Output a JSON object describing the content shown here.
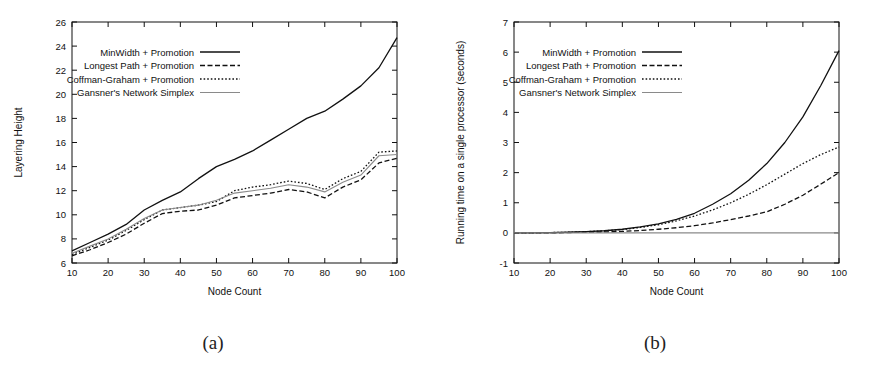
{
  "figure": {
    "caption_a": "(a)",
    "caption_b": "(b)"
  },
  "legend_entries": [
    {
      "label": "MinWidth + Promotion",
      "style": "solid",
      "color": "#111111",
      "width": 1.3
    },
    {
      "label": "Longest Path + Promotion",
      "style": "dashed",
      "color": "#111111",
      "width": 1.3
    },
    {
      "label": "Coffman-Graham + Promotion",
      "style": "dotted",
      "color": "#111111",
      "width": 1.3
    },
    {
      "label": "Gansner's Network Simplex",
      "style": "solid",
      "color": "#8a8a8a",
      "width": 1.1
    }
  ],
  "chart_data": [
    {
      "id": "chart-a",
      "type": "line",
      "title": "",
      "xlabel": "Node Count",
      "ylabel": "Layering Height",
      "xlim": [
        10,
        100
      ],
      "ylim": [
        6,
        26
      ],
      "xticks": [
        10,
        20,
        30,
        40,
        50,
        60,
        70,
        80,
        90,
        100
      ],
      "yticks": [
        6,
        8,
        10,
        12,
        14,
        16,
        18,
        20,
        22,
        24,
        26
      ],
      "grid": false,
      "legend_position": "top-center",
      "x": [
        10,
        15,
        20,
        25,
        30,
        35,
        40,
        45,
        50,
        55,
        60,
        65,
        70,
        75,
        80,
        85,
        90,
        95,
        100
      ],
      "series": [
        {
          "name": "MinWidth + Promotion",
          "style": "solid",
          "color": "#111111",
          "width": 1.3,
          "values": [
            7.0,
            7.7,
            8.4,
            9.2,
            10.4,
            11.2,
            11.9,
            13.0,
            14.0,
            14.6,
            15.3,
            16.2,
            17.1,
            18.0,
            18.6,
            19.6,
            20.7,
            22.2,
            24.7
          ]
        },
        {
          "name": "Longest Path + Promotion",
          "style": "dashed",
          "color": "#111111",
          "width": 1.3,
          "values": [
            6.6,
            7.1,
            7.7,
            8.4,
            9.3,
            10.1,
            10.3,
            10.4,
            10.8,
            11.4,
            11.6,
            11.8,
            12.1,
            11.9,
            11.4,
            12.3,
            12.9,
            14.3,
            14.7
          ]
        },
        {
          "name": "Coffman-Graham + Promotion",
          "style": "dotted",
          "color": "#111111",
          "width": 1.3,
          "values": [
            6.7,
            7.3,
            7.9,
            8.7,
            9.6,
            10.4,
            10.6,
            10.8,
            11.1,
            12.0,
            12.3,
            12.5,
            12.8,
            12.6,
            12.1,
            13.0,
            13.6,
            15.2,
            15.3
          ]
        },
        {
          "name": "Gansner's Network Simplex",
          "style": "solid",
          "color": "#8a8a8a",
          "width": 1.1,
          "values": [
            6.8,
            7.4,
            8.0,
            8.8,
            9.7,
            10.4,
            10.6,
            10.8,
            11.2,
            11.8,
            12.0,
            12.2,
            12.5,
            12.3,
            11.9,
            12.7,
            13.3,
            14.9,
            15.0
          ]
        }
      ]
    },
    {
      "id": "chart-b",
      "type": "line",
      "title": "",
      "xlabel": "Node Count",
      "ylabel": "Running time on a single processor (seconds)",
      "xlim": [
        10,
        100
      ],
      "ylim": [
        -1,
        7
      ],
      "xticks": [
        10,
        20,
        30,
        40,
        50,
        60,
        70,
        80,
        90,
        100
      ],
      "yticks": [
        -1,
        0,
        1,
        2,
        3,
        4,
        5,
        6,
        7
      ],
      "grid": false,
      "legend_position": "top-center",
      "x": [
        10,
        15,
        20,
        25,
        30,
        35,
        40,
        45,
        50,
        55,
        60,
        65,
        70,
        75,
        80,
        85,
        90,
        95,
        100
      ],
      "series": [
        {
          "name": "MinWidth + Promotion",
          "style": "solid",
          "color": "#111111",
          "width": 1.3,
          "values": [
            0.0,
            0.0,
            0.01,
            0.02,
            0.04,
            0.07,
            0.12,
            0.2,
            0.3,
            0.45,
            0.65,
            0.95,
            1.3,
            1.75,
            2.3,
            3.0,
            3.85,
            4.9,
            6.05
          ]
        },
        {
          "name": "Longest Path + Promotion",
          "style": "dashed",
          "color": "#111111",
          "width": 1.3,
          "values": [
            0.0,
            0.0,
            0.0,
            0.01,
            0.02,
            0.03,
            0.05,
            0.08,
            0.12,
            0.17,
            0.24,
            0.33,
            0.44,
            0.56,
            0.7,
            0.95,
            1.25,
            1.62,
            2.0
          ]
        },
        {
          "name": "Coffman-Graham + Promotion",
          "style": "dotted",
          "color": "#111111",
          "width": 1.3,
          "values": [
            0.0,
            0.0,
            0.01,
            0.02,
            0.04,
            0.07,
            0.11,
            0.18,
            0.27,
            0.4,
            0.56,
            0.76,
            1.0,
            1.28,
            1.6,
            1.95,
            2.3,
            2.6,
            2.85
          ]
        },
        {
          "name": "Gansner's Network Simplex",
          "style": "solid",
          "color": "#8a8a8a",
          "width": 1.1,
          "values": [
            0.0,
            0.0,
            0.0,
            0.0,
            0.0,
            0.0,
            0.0,
            0.0,
            0.0,
            0.0,
            0.0,
            0.0,
            0.0,
            0.0,
            0.0,
            0.0,
            0.0,
            0.0,
            0.0
          ]
        }
      ]
    }
  ]
}
